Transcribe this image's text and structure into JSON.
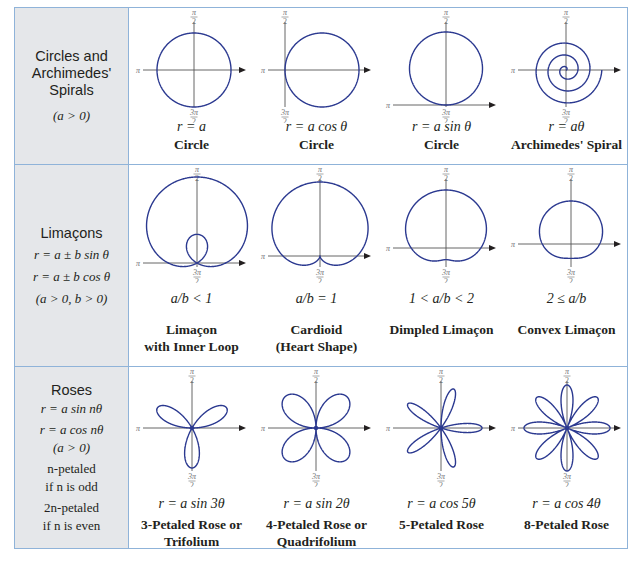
{
  "colors": {
    "curve": "#2b3990",
    "axis": "#555555",
    "border": "#8fb3d9",
    "label_bg": "#e5e7ea"
  },
  "axis_labels": {
    "top": "π/2",
    "left": "π",
    "bottom": "3π/2"
  },
  "rows": [
    {
      "category": {
        "title_lines": [
          "Circles and",
          "Archimedes'",
          "Spirals"
        ],
        "conditions": [
          "(a > 0)"
        ]
      },
      "graphs": [
        {
          "equation": "r = a",
          "name_lines": [
            "Circle"
          ],
          "curve": "circle"
        },
        {
          "equation": "r = a cos θ",
          "name_lines": [
            "Circle"
          ],
          "curve": "circle-cos"
        },
        {
          "equation": "r = a sin θ",
          "name_lines": [
            "Circle"
          ],
          "curve": "circle-sin"
        },
        {
          "equation": "r = aθ",
          "name_lines": [
            "Archimedes' Spiral"
          ],
          "curve": "spiral"
        }
      ]
    },
    {
      "category": {
        "title_lines": [
          "Limaçons"
        ],
        "conditions": [
          "r = a ± b sin θ",
          "r = a ± b cos θ",
          "(a > 0, b > 0)"
        ]
      },
      "graphs": [
        {
          "equation": "a/b < 1",
          "name_lines": [
            "Limaçon",
            "with Inner Loop"
          ],
          "curve": "limacon",
          "a": 0.5,
          "b": 1
        },
        {
          "equation": "a/b = 1",
          "name_lines": [
            "Cardioid",
            "(Heart Shape)"
          ],
          "curve": "limacon",
          "a": 1,
          "b": 1
        },
        {
          "equation": "1 < a/b < 2",
          "name_lines": [
            "Dimpled Limaçon"
          ],
          "curve": "limacon",
          "a": 1.5,
          "b": 1
        },
        {
          "equation": "2 ≤ a/b",
          "name_lines": [
            "Convex Limaçon"
          ],
          "curve": "limacon",
          "a": 2,
          "b": 1
        }
      ]
    },
    {
      "category": {
        "title_lines": [
          "Roses"
        ],
        "conditions": [
          "r = a sin nθ",
          "r = a cos nθ",
          "(a > 0)",
          "n-petaled",
          "if n is odd",
          "2n-petaled",
          "if n is even"
        ]
      },
      "graphs": [
        {
          "equation": "r = a sin 3θ",
          "name_lines": [
            "3-Petaled Rose or",
            "Trifolium"
          ],
          "curve": "rose-sin",
          "n": 3
        },
        {
          "equation": "r = a sin 2θ",
          "name_lines": [
            "4-Petaled Rose or",
            "Quadrifolium"
          ],
          "curve": "rose-sin",
          "n": 2
        },
        {
          "equation": "r = a cos 5θ",
          "name_lines": [
            "5-Petaled Rose"
          ],
          "curve": "rose-cos",
          "n": 5
        },
        {
          "equation": "r = a cos 4θ",
          "name_lines": [
            "8-Petaled Rose"
          ],
          "curve": "rose-cos",
          "n": 4
        }
      ]
    }
  ]
}
